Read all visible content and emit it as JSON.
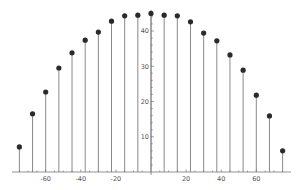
{
  "chart_data": {
    "type": "stem",
    "title": "",
    "xlabel": "",
    "ylabel": "",
    "x": [
      -75,
      -67.5,
      -60,
      -52.5,
      -45,
      -37.5,
      -30,
      -22.5,
      -15,
      -7.5,
      0,
      7.5,
      15,
      22.5,
      30,
      37.5,
      45,
      52.5,
      60,
      67.5,
      75
    ],
    "values": [
      7.1,
      16.5,
      22.7,
      29.5,
      33.8,
      37.4,
      39.7,
      42.8,
      44.3,
      44.5,
      45.0,
      44.5,
      44.3,
      42.6,
      39.4,
      37.2,
      33.2,
      28.9,
      21.8,
      15.9,
      6.0
    ],
    "xlim": [
      -79,
      79
    ],
    "ylim": [
      0,
      46
    ],
    "x_ticks": [
      -60,
      -40,
      -20,
      20,
      40,
      60
    ],
    "x_tick_labels": [
      "-60",
      "-40",
      "-20",
      "20",
      "40",
      "60"
    ],
    "y_ticks": [
      10,
      20,
      30,
      40
    ],
    "y_tick_labels": [
      "10",
      "20",
      "30",
      "40"
    ],
    "grid": false,
    "legend": null,
    "marker_color": "#2a2a2a",
    "stem_color": "#8a8a8a"
  }
}
